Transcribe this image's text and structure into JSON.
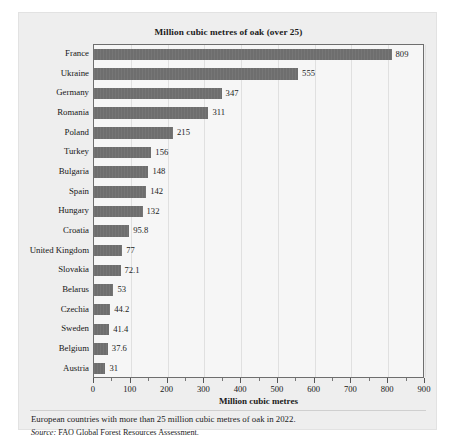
{
  "chart_data": {
    "type": "bar",
    "orientation": "horizontal",
    "title": "Million cubic metres of oak (over 25)",
    "xlabel": "Million cubic metres",
    "ylabel": "",
    "xlim": [
      0,
      900
    ],
    "xticks": [
      0,
      100,
      200,
      300,
      400,
      500,
      600,
      700,
      800,
      900
    ],
    "xtick_labels": [
      "0",
      "100",
      "200",
      "300",
      "400",
      "500",
      "600",
      "700",
      "800",
      "900"
    ],
    "minor_tick_step": 50,
    "grid": "vertical",
    "legend": "none",
    "bar_color": "#6e6e6e",
    "plot_background": "#f6f6f6",
    "panel_background": "#eeeeee",
    "categories": [
      "France",
      "Ukraine",
      "Germany",
      "Romania",
      "Poland",
      "Turkey",
      "Bulgaria",
      "Spain",
      "Hungary",
      "Croatia",
      "United Kingdom",
      "Slovakia",
      "Belarus",
      "Czechia",
      "Sweden",
      "Belgium",
      "Austria"
    ],
    "values": [
      809,
      555,
      347,
      311,
      215,
      156,
      148,
      142,
      132,
      95.8,
      77,
      72.1,
      53,
      44.2,
      41.4,
      37.6,
      31
    ],
    "value_labels": [
      "809",
      "555",
      "347",
      "311",
      "215",
      "156",
      "148",
      "142",
      "132",
      "95.8",
      "77",
      "72.1",
      "53",
      "44.2",
      "41.4",
      "37.6",
      "31"
    ]
  },
  "footer": {
    "note": "European countries with more than 25 million cubic metres of oak in 2022.",
    "source_prefix": "Source:",
    "source_text": " FAO Global Forest Resources Assessment."
  }
}
